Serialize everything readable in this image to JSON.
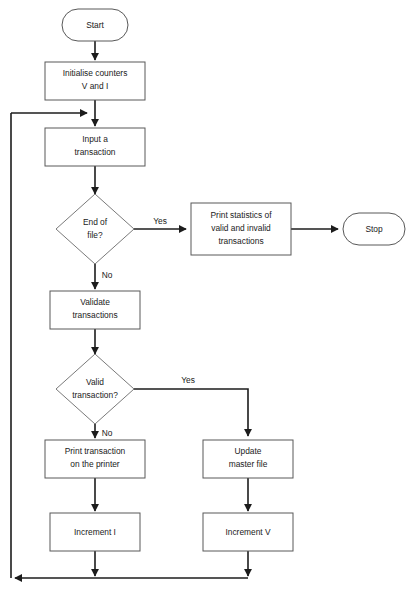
{
  "diagram": {
    "type": "flowchart",
    "background_color": "#ffffff",
    "line_color": "#1c1c1c",
    "shape_stroke_color": "#585858",
    "text_color": "#1a1a1a"
  },
  "nodes": {
    "start": {
      "shape": "terminator",
      "label": "Start",
      "lines": [
        "Start"
      ]
    },
    "init_counters": {
      "shape": "process",
      "label": "Initialise counters V and I",
      "lines": [
        "Initialise counters",
        "V and I"
      ]
    },
    "input_transaction": {
      "shape": "process",
      "label": "Input a transaction",
      "lines": [
        "Input a",
        "transaction"
      ]
    },
    "end_of_file": {
      "shape": "decision",
      "label": "End of file?",
      "lines": [
        "End of",
        "file?"
      ]
    },
    "print_statistics": {
      "shape": "process",
      "label": "Print statistics of valid and invalid transactions",
      "lines": [
        "Print statistics of",
        "valid and invalid",
        "transactions"
      ]
    },
    "stop": {
      "shape": "terminator",
      "label": "Stop",
      "lines": [
        "Stop"
      ]
    },
    "validate_transactions": {
      "shape": "process",
      "label": "Validate transactions",
      "lines": [
        "Validate",
        "transactions"
      ]
    },
    "valid_transaction": {
      "shape": "decision",
      "label": "Valid transaction?",
      "lines": [
        "Valid",
        "transaction?"
      ]
    },
    "print_transaction": {
      "shape": "process",
      "label": "Print transaction on the printer",
      "lines": [
        "Print transaction",
        "on the printer"
      ]
    },
    "update_master_file": {
      "shape": "process",
      "label": "Update master file",
      "lines": [
        "Update",
        "master file"
      ]
    },
    "increment_i": {
      "shape": "process",
      "label": "Increment I",
      "lines": [
        "Increment I"
      ]
    },
    "increment_v": {
      "shape": "process",
      "label": "Increment V",
      "lines": [
        "Increment V"
      ]
    }
  },
  "edge_labels": {
    "eof_yes": "Yes",
    "eof_no": "No",
    "valid_yes": "Yes",
    "valid_no": "No"
  },
  "edges": [
    {
      "from": "start",
      "to": "init_counters",
      "label": ""
    },
    {
      "from": "init_counters",
      "to": "input_transaction",
      "label": ""
    },
    {
      "from": "input_transaction",
      "to": "end_of_file",
      "label": ""
    },
    {
      "from": "end_of_file",
      "to": "print_statistics",
      "label": "Yes"
    },
    {
      "from": "end_of_file",
      "to": "validate_transactions",
      "label": "No"
    },
    {
      "from": "print_statistics",
      "to": "stop",
      "label": ""
    },
    {
      "from": "validate_transactions",
      "to": "valid_transaction",
      "label": ""
    },
    {
      "from": "valid_transaction",
      "to": "update_master_file",
      "label": "Yes"
    },
    {
      "from": "valid_transaction",
      "to": "print_transaction",
      "label": "No"
    },
    {
      "from": "print_transaction",
      "to": "increment_i",
      "label": ""
    },
    {
      "from": "update_master_file",
      "to": "increment_v",
      "label": ""
    },
    {
      "from": "increment_i",
      "to": "input_transaction",
      "label": ""
    },
    {
      "from": "increment_v",
      "to": "input_transaction",
      "label": ""
    }
  ]
}
